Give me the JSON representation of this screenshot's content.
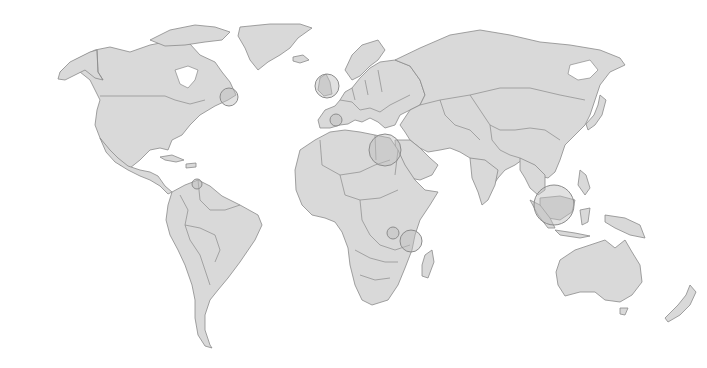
{
  "map": {
    "type": "world-choropleth-outline",
    "projection": "miller-like",
    "colors": {
      "background": "#ffffff",
      "land": "#d9d9d9",
      "border": "#8a8a8a",
      "marker_fill": "#bdbdbd",
      "marker_stroke": "#8c8c8c"
    },
    "markers": [
      {
        "name": "newfoundland",
        "x": 229,
        "y": 97,
        "r": 9
      },
      {
        "name": "united-kingdom",
        "x": 327,
        "y": 86,
        "r": 12
      },
      {
        "name": "balearic-spain",
        "x": 336,
        "y": 120,
        "r": 6
      },
      {
        "name": "egypt",
        "x": 385,
        "y": 150,
        "r": 16
      },
      {
        "name": "kenya",
        "x": 411,
        "y": 241,
        "r": 11
      },
      {
        "name": "rwanda-burundi",
        "x": 393,
        "y": 233,
        "r": 6
      },
      {
        "name": "venezuela-trinidad",
        "x": 197,
        "y": 184,
        "r": 5
      },
      {
        "name": "borneo",
        "x": 554,
        "y": 205,
        "r": 20
      }
    ]
  }
}
